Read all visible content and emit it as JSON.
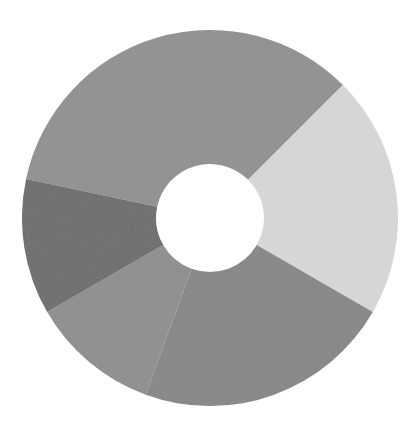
{
  "chart_data": {
    "type": "pie",
    "subtype": "donut",
    "title": "",
    "legend": [],
    "categories": [
      "Segment A",
      "Segment B",
      "Segment C",
      "Segment D",
      "Segment E"
    ],
    "values": [
      34,
      21,
      22,
      11,
      12
    ],
    "angles_deg": [
      [
        -78,
        45
      ],
      [
        45,
        120
      ],
      [
        120,
        200
      ],
      [
        200,
        240
      ],
      [
        240,
        282
      ]
    ],
    "colors": [
      "#8e8e8e",
      "#d9d9d9",
      "#848484",
      "#8c8c8c",
      "#676767"
    ],
    "center": [
      210,
      218
    ],
    "outer_radius": 188,
    "inner_radius": 54,
    "labels_visible": false
  }
}
